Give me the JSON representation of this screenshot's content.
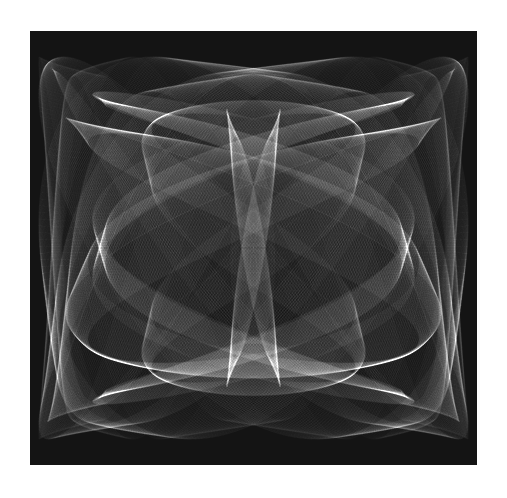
{
  "artwork": {
    "description": "Generative monochrome line art: layered translucent white parametric curves (harmonograph / Lissajous style) on a dark square, bilaterally symmetric with a bright vertical spindle at the center",
    "frame": {
      "x": 30,
      "y": 31,
      "width": 447,
      "height": 434
    },
    "colors": {
      "page_background": "#ffffff",
      "canvas_background": "#141414",
      "line_color": "#ffffff"
    },
    "render": {
      "line_alpha": 0.035,
      "line_width": 0.6,
      "strands_per_curve": 40,
      "steps": 700
    },
    "curves": [
      {
        "name": "outer-lobes",
        "ax": 0.46,
        "ay": 0.4,
        "fx": 1,
        "fy": 2,
        "phase": 1.57,
        "spread": 0.1
      },
      {
        "name": "wing-arcs",
        "ax": 0.42,
        "ay": 0.3,
        "fx": 3,
        "fy": 2,
        "phase": 0.0,
        "spread": 0.12
      },
      {
        "name": "inner-bell",
        "ax": 0.25,
        "ay": 0.34,
        "fx": 2,
        "fy": 1,
        "phase": 0.0,
        "spread": 0.09
      },
      {
        "name": "central-spindle",
        "ax": 0.06,
        "ay": 0.32,
        "fx": 1,
        "fy": 1,
        "phase": 1.57,
        "spread": 0.2
      },
      {
        "name": "cusp-ring",
        "ax": 0.36,
        "ay": 0.36,
        "fx": 4,
        "fy": 2,
        "phase": 1.2,
        "spread": 0.08
      },
      {
        "name": "top-sweeps",
        "ax": 0.48,
        "ay": 0.44,
        "fx": 1,
        "fy": 3,
        "phase": 0.6,
        "spread": 0.1
      },
      {
        "name": "bottom-sweeps",
        "ax": 0.48,
        "ay": 0.44,
        "fx": 3,
        "fy": 4,
        "phase": 0.3,
        "spread": 0.08
      }
    ]
  }
}
